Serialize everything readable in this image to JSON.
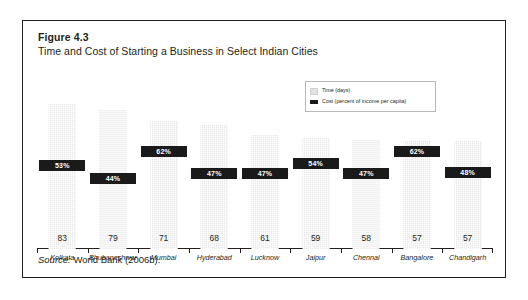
{
  "figure": {
    "label": "Figure 4.3",
    "title": "Time and Cost of Starting a Business in Select Indian Cities",
    "source_word": "Source:",
    "source_text": " World Bank (2006b)."
  },
  "legend": {
    "items": [
      {
        "label": "Time (days)",
        "swatch": "#e2e2e2"
      },
      {
        "label": "Cost (percent of income per capita)",
        "swatch": "#1a1a1a"
      }
    ]
  },
  "chart_data": {
    "type": "bar",
    "title": "Time and Cost of Starting a Business in Select Indian Cities",
    "xlabel": "",
    "ylabel": "",
    "grid": false,
    "legend_position": "top-right",
    "categories": [
      "Kolkata",
      "Bhubaneshwar",
      "Mumbai",
      "Hyderabad",
      "Lucknow",
      "Jaipur",
      "Chennai",
      "Bangalore",
      "Chandigarh"
    ],
    "series": [
      {
        "name": "Time (days)",
        "unit": "days",
        "values": [
          83,
          79,
          71,
          68,
          61,
          59,
          58,
          57,
          57
        ]
      },
      {
        "name": "Cost (percent of income per capita)",
        "unit": "percent",
        "values": [
          53,
          44,
          62,
          47,
          47,
          54,
          47,
          62,
          48
        ],
        "labels": [
          "53%",
          "44%",
          "62%",
          "47%",
          "47%",
          "54%",
          "47%",
          "62%",
          "48%"
        ]
      }
    ],
    "ylim": [
      0,
      100
    ]
  },
  "colors": {
    "bar_fill": "#e8e8e8",
    "chip_fill": "#1a1a1a",
    "text": "#231f20",
    "border": "#231f20"
  }
}
